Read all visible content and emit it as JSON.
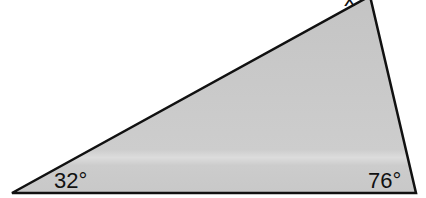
{
  "diagram": {
    "type": "triangle",
    "fill_color": "#c9c9c9",
    "stroke_color": "#111111",
    "vertices": {
      "top": [
        370,
        -4
      ],
      "bottom_left": [
        12,
        193
      ],
      "bottom_right": [
        416,
        193
      ]
    },
    "labels": {
      "top_angle": "x",
      "bottom_left_angle": "32°",
      "bottom_right_angle": "76°"
    }
  }
}
